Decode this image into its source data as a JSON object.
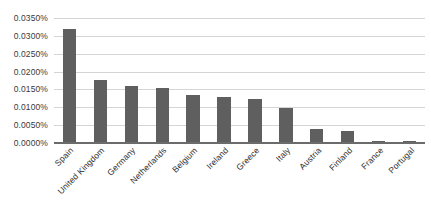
{
  "chart_data": {
    "type": "bar",
    "title": "",
    "subtitle": "",
    "xlabel": "",
    "ylabel": "",
    "grid": true,
    "legend": false,
    "legend_position": "none",
    "orientation": "vertical",
    "bar_color": "#5f5f5f",
    "gridline_color": "#d4d4d4",
    "axis_color": "#6b6b6b",
    "ylim": [
      0,
      0.035
    ],
    "y_tick_step": 0.005,
    "y_tick_format": "percent-4dp",
    "y_tick_labels": [
      "0.0350%",
      "0.0300%",
      "0.0250%",
      "0.0200%",
      "0.0150%",
      "0.0100%",
      "0.0050%",
      "0.0000%"
    ],
    "y_tick_values": [
      0.035,
      0.03,
      0.025,
      0.02,
      0.015,
      0.01,
      0.005,
      0
    ],
    "categories": [
      "Spain",
      "United Kingdom",
      "Germany",
      "Netherlands",
      "Belgium",
      "Ireland",
      "Greece",
      "Italy",
      "Austria",
      "Finland",
      "France",
      "Portugal"
    ],
    "values": [
      0.032,
      0.0176,
      0.016,
      0.0153,
      0.0135,
      0.013,
      0.0124,
      0.0099,
      0.0038,
      0.0035,
      0.0006,
      0.0005
    ],
    "value_labels": [
      "0.0320%",
      "0.0176%",
      "0.0160%",
      "0.0153%",
      "0.0135%",
      "0.0130%",
      "0.0124%",
      "0.0099%",
      "0.0038%",
      "0.0035%",
      "0.0006%",
      "0.0005%"
    ]
  }
}
